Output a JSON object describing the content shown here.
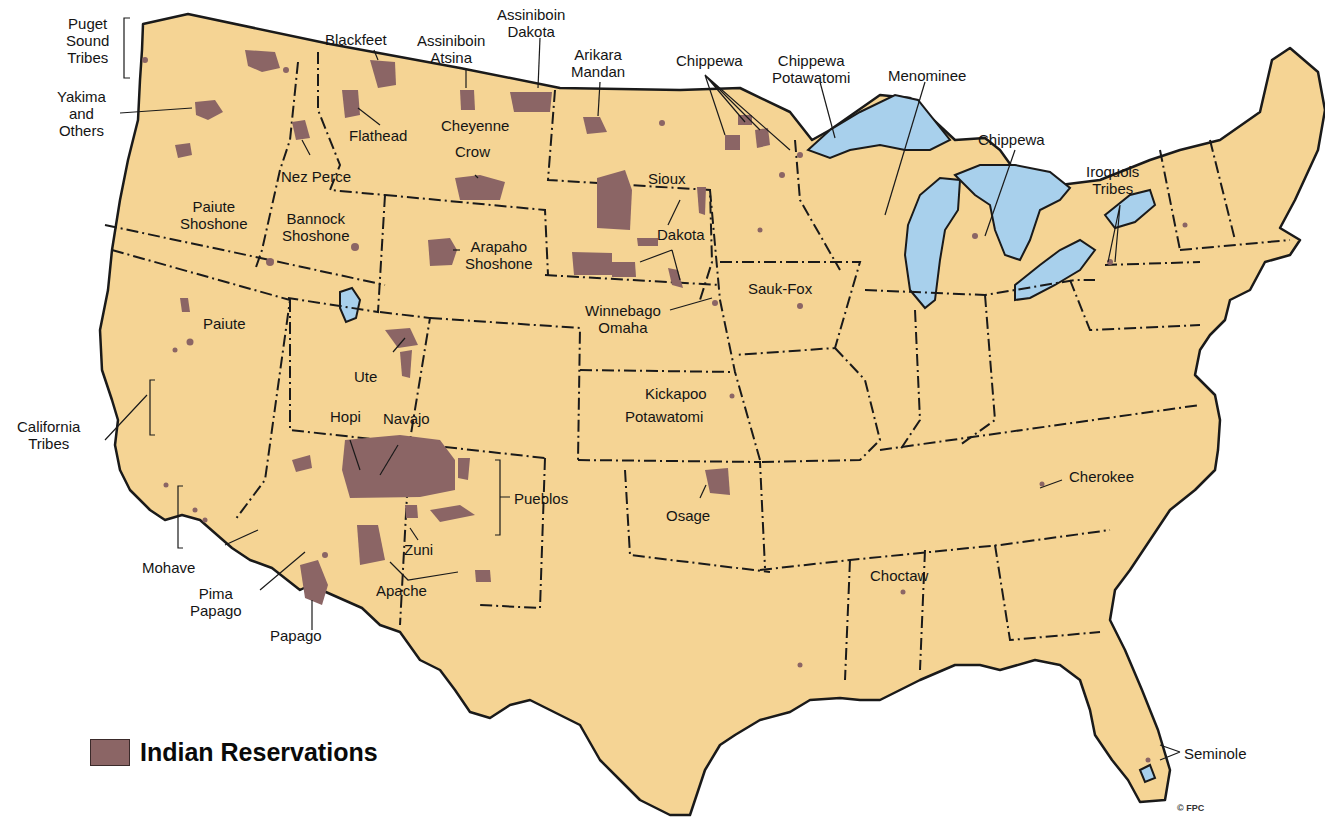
{
  "map": {
    "title": "Indian Reservations",
    "colors": {
      "land": "#F5D494",
      "reservation": "#8B6565",
      "water": "#A8D0EC",
      "border": "#1a1a1a",
      "background": "#FFFFFF"
    },
    "legend": {
      "swatch_label": "Indian Reservations"
    },
    "copyright": "© FPC",
    "labels": {
      "puget": [
        "Puget",
        "Sound",
        "Tribes"
      ],
      "yakima": [
        "Yakima",
        "and",
        "Others"
      ],
      "blackfeet": [
        "Blackfeet"
      ],
      "assiniboin_atsina": [
        "Assiniboin",
        "Atsina"
      ],
      "assiniboin_dakota": [
        "Assiniboin",
        "Dakota"
      ],
      "arikara_mandan": [
        "Arikara",
        "Mandan"
      ],
      "chippewa_mn": [
        "Chippewa"
      ],
      "chippewa_potawatomi": [
        "Chippewa",
        "Potawatomi"
      ],
      "menominee": [
        "Menominee"
      ],
      "chippewa_mi": [
        "Chippewa"
      ],
      "iroquois": [
        "Iroquois",
        "Tribes"
      ],
      "flathead": [
        "Flathead"
      ],
      "cheyenne": [
        "Cheyenne"
      ],
      "crow": [
        "Crow"
      ],
      "nez_perce": [
        "Nez Perce"
      ],
      "sioux": [
        "Sioux"
      ],
      "paiute_shoshone": [
        "Paiute",
        "Shoshone"
      ],
      "bannock_shoshone": [
        "Bannock",
        "Shoshone"
      ],
      "arapaho_shoshone": [
        "Arapaho",
        "Shoshone"
      ],
      "dakota": [
        "Dakota"
      ],
      "winnebago_omaha": [
        "Winnebago",
        "Omaha"
      ],
      "sauk_fox": [
        "Sauk-Fox"
      ],
      "paiute": [
        "Paiute"
      ],
      "ute": [
        "Ute"
      ],
      "kickapoo": [
        "Kickapoo"
      ],
      "potawatomi": [
        "Potawatomi"
      ],
      "california": [
        "California",
        "Tribes"
      ],
      "hopi": [
        "Hopi"
      ],
      "navajo": [
        "Navajo"
      ],
      "pueblos": [
        "Pueblos"
      ],
      "osage": [
        "Osage"
      ],
      "cherokee": [
        "Cherokee"
      ],
      "zuni": [
        "Zuni"
      ],
      "mohave": [
        "Mohave"
      ],
      "pima_papago": [
        "Pima",
        "Papago"
      ],
      "apache": [
        "Apache"
      ],
      "choctaw": [
        "Choctaw"
      ],
      "papago": [
        "Papago"
      ],
      "seminole": [
        "Seminole"
      ]
    }
  }
}
